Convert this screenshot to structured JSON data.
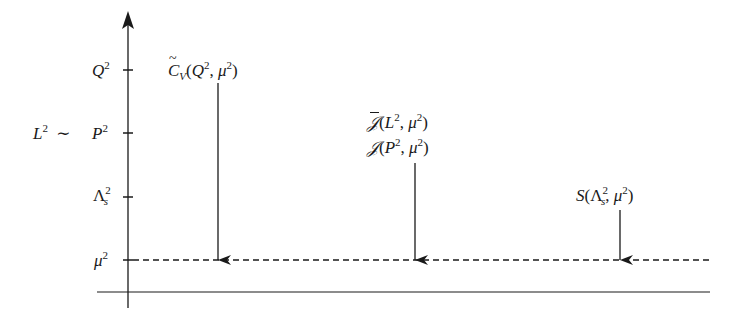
{
  "diagram": {
    "type": "scale-hierarchy",
    "axis": {
      "direction": "vertical",
      "arrow": "up",
      "color": "#1a1a1a"
    },
    "left_prefix": "L² ∼",
    "ticks": [
      {
        "id": "Q",
        "base": "Q",
        "sup": "2",
        "sub": ""
      },
      {
        "id": "P",
        "base": "P",
        "sup": "2",
        "sub": ""
      },
      {
        "id": "Lambda",
        "base": "Λ",
        "sup": "2",
        "sub": "s"
      },
      {
        "id": "mu",
        "base": "μ",
        "sup": "2",
        "sub": ""
      }
    ],
    "dashed_line": {
      "level": "μ²",
      "style": "dashed"
    },
    "functions": [
      {
        "id": "hard",
        "lines": [
          "C̃_V(Q², μ²)"
        ],
        "from_level": "Q²",
        "to_level": "μ²"
      },
      {
        "id": "jet",
        "lines": [
          "J̄(L², μ²)",
          "J(P², μ²)"
        ],
        "from_level": "P²",
        "to_level": "μ²"
      },
      {
        "id": "soft",
        "lines": [
          "S(Λ_s², μ²)"
        ],
        "from_level": "Λ_s²",
        "to_level": "μ²"
      }
    ],
    "text": {
      "L": "L",
      "sim": "∼",
      "Q": "Q",
      "P": "P",
      "Lambda": "Λ",
      "mu": "μ",
      "s": "s",
      "two": "2",
      "C": "C",
      "V": "V",
      "J": "𝒥",
      "S": "S",
      "lp": "(",
      "rp": ")",
      "comma": ", "
    }
  }
}
